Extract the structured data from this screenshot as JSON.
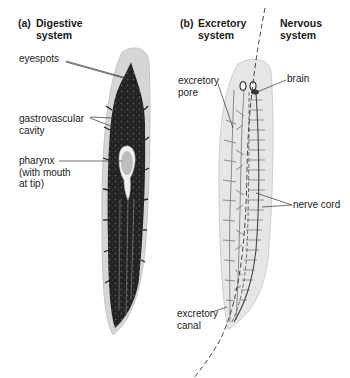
{
  "panels": [
    {
      "tag": "(a)",
      "title_line1": "Digestive",
      "title_line2": "system"
    },
    {
      "tag": "(b)",
      "title_line1": "Excretory",
      "title_line2": "system"
    },
    {
      "tag": "",
      "title_line1": "Nervous",
      "title_line2": "system"
    }
  ],
  "labels": {
    "eyespots": "eyespots",
    "gastrovascular_line1": "gastrovascular",
    "gastrovascular_line2": "cavity",
    "pharynx_line1": "pharynx",
    "pharynx_line2": "(with mouth",
    "pharynx_line3": "at tip)",
    "excretory_pore_line1": "excretory",
    "excretory_pore_line2": "pore",
    "brain": "brain",
    "nerve_cord": "nerve cord",
    "excretory_canal_line1": "excretory",
    "excretory_canal_line2": "canal"
  },
  "colors": {
    "body_fill": "#d9d9d9",
    "gut_dark": "#1e1e1e",
    "canal_gray": "#8a8a8a",
    "leader_line": "#333333"
  }
}
